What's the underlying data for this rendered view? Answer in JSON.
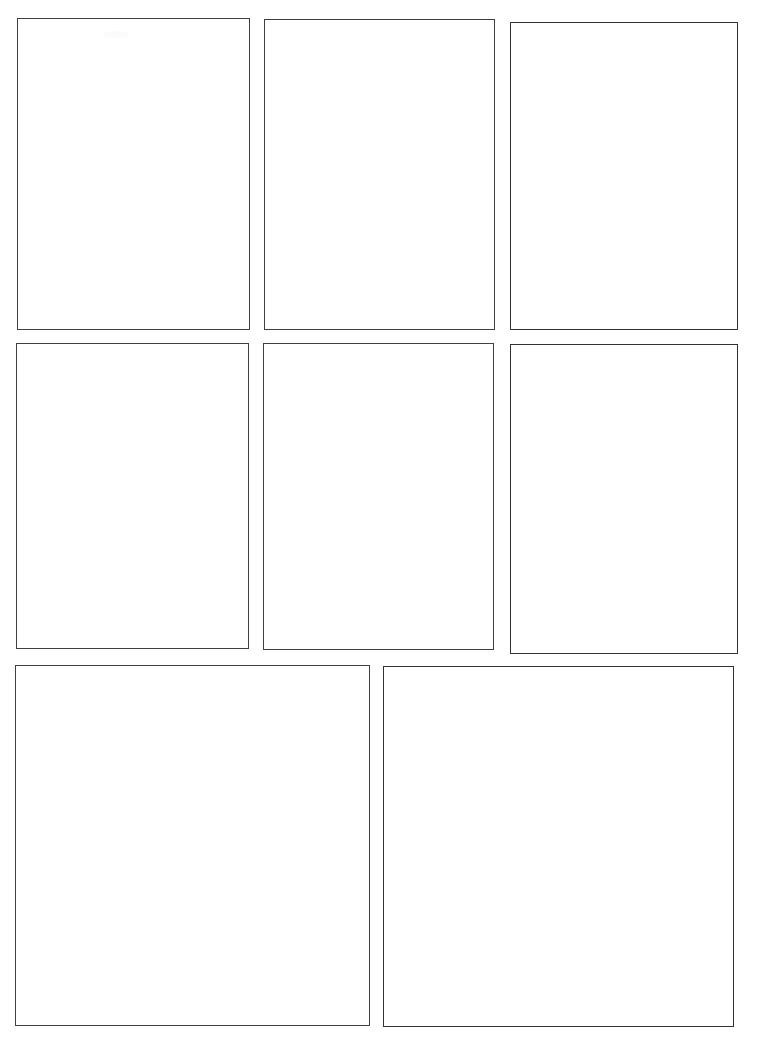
{
  "page": {
    "background_color": "#ffffff",
    "line_color": "#3a3a3a",
    "width": 767,
    "height": 1053,
    "content_text": ""
  },
  "layout": {
    "rows": 3,
    "row_panel_counts": [
      3,
      3,
      2
    ],
    "total_panels": 8
  },
  "panels": [
    {
      "id": "panel-1",
      "row": 1,
      "column": 1,
      "label": "",
      "content": "",
      "x": 17,
      "y": 18,
      "width": 233,
      "height": 312,
      "ink": "ink-mid",
      "artifact": true,
      "artifact_x": 102,
      "artifact_y": 30
    },
    {
      "id": "panel-2",
      "row": 1,
      "column": 2,
      "label": "",
      "content": "",
      "x": 264,
      "y": 19,
      "width": 231,
      "height": 311,
      "ink": "ink-mid",
      "artifact": false
    },
    {
      "id": "panel-3",
      "row": 1,
      "column": 3,
      "label": "",
      "content": "",
      "x": 510,
      "y": 22,
      "width": 228,
      "height": 308,
      "ink": "ink-dark",
      "artifact": false
    },
    {
      "id": "panel-4",
      "row": 2,
      "column": 1,
      "label": "",
      "content": "",
      "x": 16,
      "y": 343,
      "width": 233,
      "height": 306,
      "ink": "ink-mid",
      "artifact": false
    },
    {
      "id": "panel-5",
      "row": 2,
      "column": 2,
      "label": "",
      "content": "",
      "x": 263,
      "y": 343,
      "width": 231,
      "height": 307,
      "ink": "ink-mid",
      "artifact": false
    },
    {
      "id": "panel-6",
      "row": 2,
      "column": 3,
      "label": "",
      "content": "",
      "x": 510,
      "y": 344,
      "width": 228,
      "height": 310,
      "ink": "ink-dark",
      "artifact": false
    },
    {
      "id": "panel-7",
      "row": 3,
      "column": 1,
      "label": "",
      "content": "",
      "x": 15,
      "y": 665,
      "width": 355,
      "height": 361,
      "ink": "ink-mid",
      "artifact": false
    },
    {
      "id": "panel-8",
      "row": 3,
      "column": 2,
      "label": "",
      "content": "",
      "x": 383,
      "y": 666,
      "width": 351,
      "height": 361,
      "ink": "ink-dark",
      "artifact": false
    }
  ]
}
